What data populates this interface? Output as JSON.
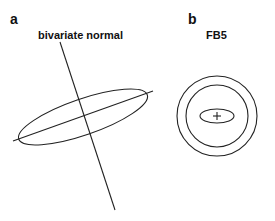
{
  "panels": [
    {
      "label": "a",
      "title": "bivariate normal",
      "shape": {
        "type": "rotated-ellipse-with-axes",
        "center": [
          83,
          117
        ],
        "rx": 68,
        "ry": 18,
        "rotation_deg": -19,
        "major_axis": [
          [
            13,
            141
          ],
          [
            153,
            91
          ]
        ],
        "minor_axis": [
          [
            60,
            42
          ],
          [
            115,
            210
          ]
        ]
      }
    },
    {
      "label": "b",
      "title": "FB5",
      "shape": {
        "type": "concentric-contours",
        "center": [
          217,
          116
        ],
        "outer_circle_r": 40,
        "middle_circle_r": 31,
        "inner_ellipse": {
          "rx": 17,
          "ry": 7
        },
        "center_marker": "+"
      }
    }
  ],
  "colors": {
    "stroke": "#222222",
    "background": "#ffffff"
  }
}
